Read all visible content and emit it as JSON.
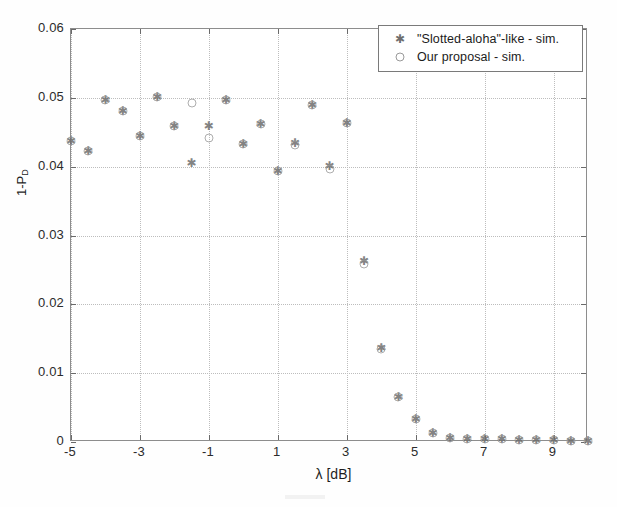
{
  "chart_data": {
    "type": "scatter",
    "title": "",
    "xlabel": "λ [dB]",
    "ylabel": "1-P_D",
    "ylabel_base": "1-P",
    "ylabel_sub": "D",
    "xlim": [
      -5,
      10
    ],
    "ylim": [
      0,
      0.06
    ],
    "grid": true,
    "legend_position": "top-right",
    "xticks": [
      -5,
      -3,
      -1,
      1,
      3,
      5,
      7,
      9
    ],
    "xtick_labels": [
      "-5",
      "-3",
      "-1",
      "1",
      "3",
      "5",
      "7",
      "9"
    ],
    "yticks": [
      0,
      0.01,
      0.02,
      0.03,
      0.04,
      0.05,
      0.06
    ],
    "ytick_labels": [
      "0",
      "0.01",
      "0.02",
      "0.03",
      "0.04",
      "0.05",
      "0.06"
    ],
    "x": [
      -5,
      -4.5,
      -4,
      -3.5,
      -3,
      -2.5,
      -2,
      -1.5,
      -1,
      -0.5,
      0,
      0.5,
      1,
      1.5,
      2,
      2.5,
      3,
      3.5,
      4,
      4.5,
      5,
      5.5,
      6,
      6.5,
      7,
      7.5,
      8,
      8.5,
      9,
      9.5,
      10
    ],
    "series": [
      {
        "name": "\"Slotted-aloha\"-like - sim.",
        "marker": "asterisk",
        "color": "#6e6e6e",
        "values": [
          0.0438,
          0.0423,
          0.0497,
          0.0481,
          0.0444,
          0.0501,
          0.0459,
          0.0406,
          0.0459,
          0.0497,
          0.0433,
          0.0462,
          0.0394,
          0.0434,
          0.0489,
          0.0401,
          0.0464,
          0.0263,
          0.0136,
          0.0066,
          0.0034,
          0.0013,
          0.0006,
          0.0005,
          0.0004,
          0.0004,
          0.0003,
          0.0003,
          0.0003,
          0.0002,
          0.0002
        ]
      },
      {
        "name": "Our proposal - sim.",
        "marker": "circle",
        "color": "#9a9a9a",
        "values": [
          0.0438,
          0.0423,
          0.0497,
          0.0481,
          0.0444,
          0.0501,
          0.0459,
          0.0493,
          0.0442,
          0.0497,
          0.0433,
          0.0462,
          0.0394,
          0.0432,
          0.0489,
          0.0396,
          0.0464,
          0.0258,
          0.0135,
          0.0066,
          0.0033,
          0.0013,
          0.0006,
          0.0005,
          0.0004,
          0.0004,
          0.0003,
          0.0003,
          0.0003,
          0.0002,
          0.0002
        ]
      }
    ]
  },
  "legend": {
    "entries": [
      {
        "label": "\"Slotted-aloha\"-like - sim.",
        "marker": "asterisk"
      },
      {
        "label": "Our proposal - sim.",
        "marker": "circle"
      }
    ]
  }
}
